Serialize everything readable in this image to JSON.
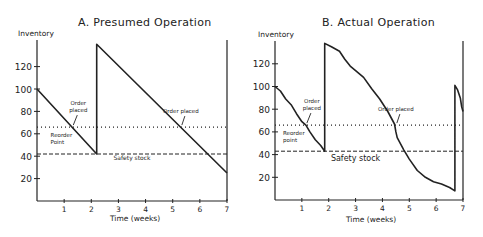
{
  "chart_data": [
    {
      "id": "A",
      "type": "line",
      "title": "A.  Presumed Operation",
      "xlabel": "Time (weeks)",
      "ylabel": "Inventory",
      "xlim": [
        0,
        7
      ],
      "ylim": [
        0,
        140
      ],
      "xticks": [
        1,
        2,
        3,
        4,
        5,
        6,
        7
      ],
      "yticks": [
        20,
        40,
        60,
        80,
        100,
        120
      ],
      "grid": false,
      "series": [
        {
          "name": "Inventory level",
          "style": "solid",
          "x": [
            0,
            2.2,
            2.2,
            7
          ],
          "y": [
            100,
            42,
            140,
            25
          ]
        },
        {
          "name": "Reorder point",
          "style": "dotted",
          "x": [
            0,
            7
          ],
          "y": [
            66,
            66
          ]
        },
        {
          "name": "Safety stock",
          "style": "dashed",
          "x": [
            0,
            7
          ],
          "y": [
            42,
            42
          ]
        }
      ],
      "annotations": [
        {
          "text": "Order placed",
          "lines": [
            "Order",
            "placed"
          ],
          "x": 1.3,
          "y": 66
        },
        {
          "text": "Order placed",
          "lines": [
            "Order placed"
          ],
          "x": 5.3,
          "y": 66
        },
        {
          "text": "Reorder Point",
          "lines": [
            "Reorder",
            "Point"
          ],
          "x": 0.5,
          "y": 60
        },
        {
          "text": "Safety stock",
          "lines": [
            "Safety stock"
          ],
          "x": 3.5,
          "y": 37
        }
      ]
    },
    {
      "id": "B",
      "type": "line",
      "title": "B.  Actual Operation",
      "xlabel": "Time (weeks)",
      "ylabel": "Inventory",
      "xlim": [
        0,
        7
      ],
      "ylim": [
        0,
        140
      ],
      "xticks": [
        1,
        2,
        3,
        4,
        5,
        6,
        7
      ],
      "yticks": [
        20,
        40,
        60,
        80,
        100,
        120
      ],
      "grid": false,
      "series": [
        {
          "name": "Inventory level",
          "style": "solid",
          "x": [
            0,
            0.2,
            0.4,
            0.6,
            0.8,
            1.0,
            1.15,
            1.3,
            1.5,
            1.7,
            1.85,
            1.85,
            2.1,
            2.4,
            2.6,
            2.8,
            3.0,
            3.3,
            3.6,
            3.9,
            4.2,
            4.45,
            4.5,
            4.55,
            4.8,
            5.0,
            5.3,
            5.6,
            5.9,
            6.2,
            6.5,
            6.7,
            6.7,
            6.8,
            6.9,
            6.95,
            7.0
          ],
          "y": [
            100,
            96,
            89,
            84,
            76,
            69,
            66,
            60,
            53,
            48,
            43,
            138,
            135,
            131,
            124,
            118,
            114,
            108,
            98,
            89,
            78,
            67,
            60,
            55,
            44,
            36,
            26,
            20,
            16,
            14,
            11,
            8,
            101,
            97,
            90,
            82,
            78
          ]
        },
        {
          "name": "Reorder point",
          "style": "dotted",
          "x": [
            0,
            7
          ],
          "y": [
            66,
            66
          ]
        },
        {
          "name": "Safety stock",
          "style": "dashed",
          "x": [
            0,
            7
          ],
          "y": [
            43,
            43
          ]
        }
      ],
      "annotations": [
        {
          "text": "Order placed",
          "lines": [
            "Order",
            "placed"
          ],
          "x": 1.15,
          "y": 66
        },
        {
          "text": "Order placed",
          "lines": [
            "Order placed"
          ],
          "x": 4.5,
          "y": 66
        },
        {
          "text": "Reorder point",
          "lines": [
            "Reorder",
            "point"
          ],
          "x": 0.3,
          "y": 60
        },
        {
          "text": "Safety stock",
          "lines": [
            "Safety stock"
          ],
          "x": 3.0,
          "y": 36
        }
      ]
    }
  ]
}
